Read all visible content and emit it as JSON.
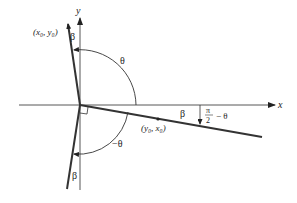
{
  "diagram": {
    "type": "geometry-rotation-diagram",
    "axes": {
      "x_label": "x",
      "y_label": "y"
    },
    "points": {
      "upper": "(x₀, y₀)",
      "lower": "(y₀, x₀)"
    },
    "angles": {
      "theta_upper": "θ",
      "theta_lower": "−θ",
      "beta_top": "β",
      "beta_right": "β",
      "beta_bottom": "β",
      "pi_over_2_numerator": "π",
      "pi_over_2_denominator": "2",
      "pi_over_2_suffix": "− θ"
    },
    "annotations": {
      "right_angle_marker": "right-angle",
      "angle_label_right": "π/2 − θ"
    },
    "colors": {
      "line": "#333333",
      "thin_line": "#444444",
      "background": "#ffffff"
    }
  }
}
